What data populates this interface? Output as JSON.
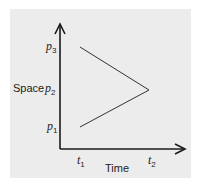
{
  "diagram": {
    "y_axis_label": "Space",
    "x_axis_label": "Time",
    "y_ticks": [
      {
        "symbol": "p",
        "sub": "3"
      },
      {
        "symbol": "p",
        "sub": "2"
      },
      {
        "symbol": "p",
        "sub": "1"
      }
    ],
    "x_ticks": [
      {
        "symbol": "t",
        "sub": "1"
      },
      {
        "symbol": "t",
        "sub": "2"
      }
    ],
    "path_points": [
      {
        "t": "t1",
        "p": "p3"
      },
      {
        "t": "t2",
        "p": "p2"
      },
      {
        "t": "t1",
        "p": "p1"
      }
    ],
    "colors": {
      "background": "#ececec",
      "ink": "#222222"
    }
  }
}
